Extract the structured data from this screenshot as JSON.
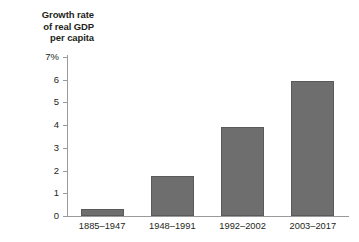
{
  "chart_data": {
    "type": "bar",
    "title": "Growth rate of real GDP per capita",
    "title_lines": [
      "Growth rate",
      "of real GDP",
      "per capita"
    ],
    "xlabel": "",
    "ylabel": "Growth rate of real GDP per capita",
    "categories": [
      "1885–1947",
      "1948–1991",
      "1992–2002",
      "2003–2017"
    ],
    "values": [
      0.3,
      1.75,
      3.9,
      5.95
    ],
    "ylim": [
      0,
      7
    ],
    "yticks": [
      0,
      1,
      2,
      3,
      4,
      5,
      6,
      7
    ],
    "ytick_labels": [
      "0",
      "1",
      "2",
      "3",
      "4",
      "5",
      "6",
      "7%"
    ],
    "unit": "%",
    "grid": false,
    "legend": false,
    "bar_color": "#6e6e6e",
    "bar_edge_color": "#5a5a5a",
    "axis_color": "#9a9a9a",
    "background": "#ffffff"
  }
}
